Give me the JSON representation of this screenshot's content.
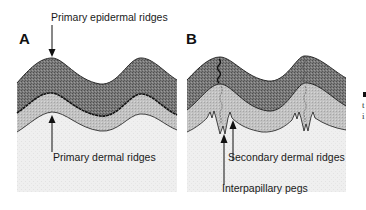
{
  "figure": {
    "panels": [
      {
        "id": "A",
        "letter": "A"
      },
      {
        "id": "B",
        "letter": "B"
      }
    ],
    "labels": {
      "primary_epidermal_ridges": "Primary epidermal ridges",
      "primary_dermal_ridges": "Primary dermal ridges",
      "secondary_dermal_ridges": "Secondary dermal ridges",
      "interpapillary_pegs": "Interpapillary pegs"
    },
    "side_text": {
      "line1": "t",
      "line2": "i"
    },
    "colors": {
      "epidermis_dark": "#6f6f6f",
      "dermal_mid": "#b9b9b9",
      "dermis_light": "#ececec",
      "outline": "#1a1a1a"
    }
  }
}
